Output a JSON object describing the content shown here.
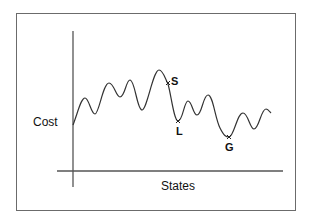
{
  "diagram": {
    "title": "",
    "y_axis_label": "Cost",
    "x_axis_label": "States",
    "points": [
      {
        "id": "S",
        "label": "S",
        "description": "current state"
      },
      {
        "id": "L",
        "label": "L",
        "description": "local minimum"
      },
      {
        "id": "G",
        "label": "G",
        "description": "global minimum"
      }
    ],
    "colors": {
      "curve": "#333333",
      "axes": "#555555",
      "frame": "#6b6b6b",
      "text": "#111111"
    }
  }
}
